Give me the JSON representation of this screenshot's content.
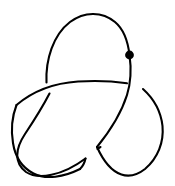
{
  "figure": {
    "name": "trefoil-knot-diagram",
    "background_color": "#ffffff",
    "stroke_color": "#000000",
    "stroke_width": 2.1,
    "width": 175,
    "height": 186,
    "crossing_count": 3,
    "component_count": 1
  },
  "basepoint": {
    "name": "basepoint",
    "label": "",
    "cx": 129.5,
    "cy": 55,
    "r": 4.4,
    "color": "#000000"
  },
  "strands": [
    {
      "name": "top-loop-left-upper",
      "description": "Left side of upper loop rising from left crossing up over the top and down to the basepoint",
      "d": "M 46.5 82.5 C 45.5 60 53 35 70 22 C 84 11.5 102 11 115 22 C 124 29.5 128 42 129.5 55"
    },
    {
      "name": "top-loop-right-descending",
      "description": "From the basepoint descending through the right crossing as the over-strand toward the bottom crossing",
      "d": "M 129.5 55 C 131.5 69 131 82 127 95 C 121 114 110 131 97 147"
    },
    {
      "name": "over-arc-left-to-right",
      "description": "Upper horizontal over-strand crossing the left vertical strand and ending at the right crossing",
      "d": "M 16.5 105 C 33 91 55 83 78 81.5 C 96 80.3 112 81 127 83.3"
    },
    {
      "name": "left-lobe-lower",
      "description": "Left lobe: from below the left crossing sweeping down and around the bottom left to the bottom crossing",
      "d": "M 49.5 93.5 C 42 108 33 122 25 134 C 15 149 14 163 26 172 C 38 180 62 176 85.5 158.5"
    },
    {
      "name": "left-lobe-outer-left",
      "description": "Outer left boundary of the left lobe",
      "d": "M 16.5 105 C 11.5 118 11 131 13 143 C 15 156 21 167 33.5 173.5 C 46 180 64 177 80 169"
    },
    {
      "name": "right-lobe",
      "description": "Right lobe: from the right crossing sweeping right, down around the bottom right and back to the bottom crossing",
      "d": "M 143 89 C 154 99 161 112 162.5 126 C 164 142 158 158 145 169 C 131 180 112 180 97 147"
    },
    {
      "name": "bottom-under-arc-left",
      "description": "Under-strand piece approaching the bottom crossing from lower left",
      "d": "M 80 169 C 84 165 85 161 85.5 158.5"
    },
    {
      "name": "bottom-under-arc-right",
      "description": "Under-strand piece leaving the bottom crossing toward the upper right",
      "d": "M 97.5 149 C 98.5 148 99.5 147.5 100.5 147"
    }
  ],
  "crossings": [
    {
      "name": "crossing-left",
      "x": 48,
      "y": 87,
      "over_strand": "over-arc-left-to-right",
      "under_strand": "top-loop-left-upper"
    },
    {
      "name": "crossing-right",
      "x": 134,
      "y": 86,
      "over_strand": "top-loop-right-descending",
      "under_strand": "over-arc-left-to-right"
    },
    {
      "name": "crossing-bottom",
      "x": 91,
      "y": 154,
      "over_strand": "top-loop-right-descending",
      "under_strand": "left-lobe-lower"
    }
  ]
}
